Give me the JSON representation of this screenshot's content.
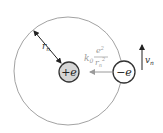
{
  "diagram": {
    "orbit": {
      "cx": 68,
      "cy": 71,
      "r": 54,
      "stroke": "#8a8a8a"
    },
    "nucleus": {
      "label_sign": "+",
      "label_var": "e",
      "cx": 69,
      "cy": 72,
      "r": 10,
      "fill": "#d6d6d6",
      "stroke": "#333333"
    },
    "electron": {
      "label_sign": "−",
      "label_var": "e",
      "cx": 124,
      "cy": 72,
      "r": 11,
      "fill": "#ffffff",
      "stroke": "#333333"
    },
    "radius_label": {
      "main": "r",
      "sub": "n"
    },
    "force": {
      "coef": "k",
      "coef_sub": "0",
      "numerator": "e",
      "numerator_sup": "2",
      "denominator": "r",
      "denominator_sub": "n",
      "denominator_sup": "2",
      "color": "#9a9a9a"
    },
    "velocity": {
      "main": "v",
      "sub": "n"
    }
  }
}
